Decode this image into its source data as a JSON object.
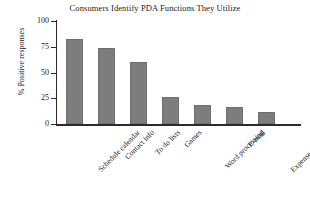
{
  "chart_data": {
    "type": "bar",
    "title": "Consumers Identify PDA Functions They Utilize",
    "xlabel": "",
    "ylabel": "% Positive responses",
    "categories": [
      "Schedule calendar",
      "Contact info",
      "To do lists",
      "Games",
      "Word processing",
      "E-mail",
      "Expense programs"
    ],
    "values": [
      83,
      74,
      60,
      26,
      18,
      17,
      12
    ],
    "ylim": [
      0,
      100
    ],
    "yticks": [
      0,
      25,
      50,
      75,
      100
    ],
    "ytick_labels": [
      "0",
      "25",
      "50",
      "75",
      "100"
    ],
    "grid": false,
    "legend": null,
    "bar_color": "#7d7d7d",
    "axis_color": "#2b2b2b",
    "background_color": "#ffffff",
    "text_color": "#1a1a1a"
  }
}
